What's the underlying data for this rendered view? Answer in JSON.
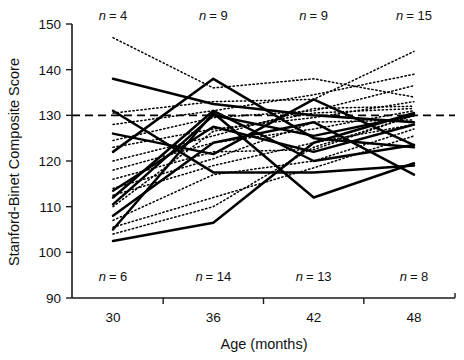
{
  "chart_data": {
    "type": "line",
    "title": "",
    "xlabel": "Age (months)",
    "ylabel": "Stanford-Binet Composite Score",
    "x": [
      30,
      36,
      42,
      48
    ],
    "xtick_labels": [
      "30",
      "36",
      "42",
      "48"
    ],
    "ytick_labels": [
      "90",
      "100",
      "110",
      "120",
      "130",
      "140",
      "150"
    ],
    "yticks": [
      90,
      100,
      110,
      120,
      130,
      140,
      150
    ],
    "xlim": [
      30,
      48
    ],
    "ylim": [
      90,
      150
    ],
    "grid": false,
    "legend": "none",
    "reference_line": {
      "value": 130,
      "style": "dashed",
      "label": ""
    },
    "annotations_top": [
      {
        "x": 30,
        "text": "n = 4",
        "n": 4
      },
      {
        "x": 36,
        "text": "n = 9",
        "n": 9
      },
      {
        "x": 42,
        "text": "n = 9",
        "n": 9
      },
      {
        "x": 48,
        "text": "n = 15",
        "n": 15
      }
    ],
    "annotations_bottom": [
      {
        "x": 30,
        "text": "n = 6",
        "n": 6
      },
      {
        "x": 36,
        "text": "n = 14",
        "n": 14
      },
      {
        "x": 42,
        "text": "n = 13",
        "n": 13
      },
      {
        "x": 48,
        "text": "n = 8",
        "n": 8
      }
    ],
    "series": [
      {
        "name": "solid-1",
        "style": "solid",
        "values": [
          138.0,
          132.5,
          130.0,
          128.5
        ]
      },
      {
        "name": "solid-2",
        "style": "solid",
        "values": [
          131.0,
          117.5,
          117.5,
          119.0
        ]
      },
      {
        "name": "solid-3",
        "style": "solid",
        "values": [
          126.0,
          121.5,
          133.5,
          123.5
        ]
      },
      {
        "name": "solid-4",
        "style": "solid",
        "values": [
          122.0,
          138.0,
          125.0,
          123.0
        ]
      },
      {
        "name": "solid-5",
        "style": "solid",
        "values": [
          113.5,
          127.5,
          122.0,
          128.0
        ]
      },
      {
        "name": "solid-6",
        "style": "solid",
        "values": [
          112.0,
          131.0,
          120.0,
          123.5
        ]
      },
      {
        "name": "solid-7",
        "style": "solid",
        "values": [
          110.5,
          130.0,
          125.5,
          130.0
        ]
      },
      {
        "name": "solid-8",
        "style": "solid",
        "values": [
          108.0,
          124.0,
          128.5,
          117.0
        ]
      },
      {
        "name": "solid-9",
        "style": "solid",
        "values": [
          105.0,
          130.5,
          112.0,
          119.5
        ]
      },
      {
        "name": "solid-10",
        "style": "solid",
        "values": [
          102.5,
          106.5,
          124.0,
          130.5
        ]
      },
      {
        "name": "dotted-1",
        "style": "dotted",
        "values": [
          147.0,
          136.0,
          138.0,
          134.0
        ]
      },
      {
        "name": "dotted-2",
        "style": "dotted",
        "values": [
          130.5,
          133.0,
          133.5,
          144.0
        ]
      },
      {
        "name": "dotted-3",
        "style": "dotted",
        "values": [
          128.0,
          131.0,
          134.5,
          139.0
        ]
      },
      {
        "name": "dotted-4",
        "style": "dotted",
        "values": [
          124.5,
          129.5,
          131.0,
          136.5
        ]
      },
      {
        "name": "dotted-5",
        "style": "dotted",
        "values": [
          123.0,
          127.0,
          129.5,
          133.0
        ]
      },
      {
        "name": "dotted-6",
        "style": "dotted",
        "values": [
          120.0,
          125.5,
          131.5,
          132.0
        ]
      },
      {
        "name": "dotted-7",
        "style": "dotted",
        "values": [
          118.0,
          124.0,
          127.0,
          131.0
        ]
      },
      {
        "name": "dotted-8",
        "style": "dotted",
        "values": [
          116.0,
          122.0,
          122.5,
          130.0
        ]
      },
      {
        "name": "dotted-9",
        "style": "dotted",
        "values": [
          114.0,
          120.5,
          128.5,
          129.0
        ]
      },
      {
        "name": "dotted-10",
        "style": "dotted",
        "values": [
          112.5,
          119.0,
          124.0,
          128.0
        ]
      },
      {
        "name": "dotted-11",
        "style": "dotted",
        "values": [
          110.0,
          126.5,
          130.5,
          131.5
        ]
      },
      {
        "name": "dotted-12",
        "style": "dotted",
        "values": [
          107.0,
          117.0,
          120.0,
          127.0
        ]
      },
      {
        "name": "dotted-13",
        "style": "dotted",
        "values": [
          105.5,
          112.0,
          118.5,
          125.5
        ]
      },
      {
        "name": "dotted-14",
        "style": "dotted",
        "values": [
          104.0,
          110.0,
          123.0,
          130.0
        ]
      }
    ]
  }
}
